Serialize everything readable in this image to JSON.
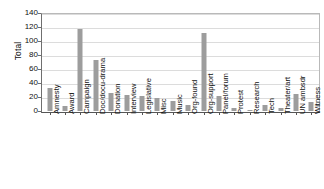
{
  "chart_data": {
    "type": "bar",
    "title": "",
    "subtitle": "",
    "xlabel": "",
    "ylabel": "Total",
    "ylim": [
      0,
      140
    ],
    "yticks": [
      0,
      20,
      40,
      60,
      80,
      100,
      120,
      140
    ],
    "grid": true,
    "legend": null,
    "bar_color": "#9d9d9d",
    "categories": [
      "Amnesty",
      "Award",
      "Campaign",
      "Doc/docu-drama",
      "Donation",
      "Interview",
      "Legislative",
      "Misc",
      "Music",
      "Org-found",
      "Org-support",
      "Panel/forum",
      "Protest",
      "Research",
      "Tech",
      "Theater/art",
      "UN ambsdr",
      "Witness"
    ],
    "values": [
      33,
      7,
      117,
      73,
      26,
      23,
      21,
      18,
      14,
      9,
      112,
      22,
      5,
      2,
      8,
      4,
      24,
      13
    ]
  }
}
